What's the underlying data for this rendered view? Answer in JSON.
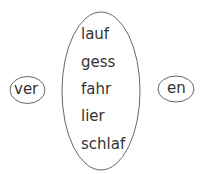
{
  "diagram": {
    "prefix": "ver",
    "suffix": "en",
    "stems": [
      "lauf",
      "gess",
      "fahr",
      "lier",
      "schlaf"
    ],
    "stroke_color": "#666666",
    "text_color": "#333333"
  }
}
